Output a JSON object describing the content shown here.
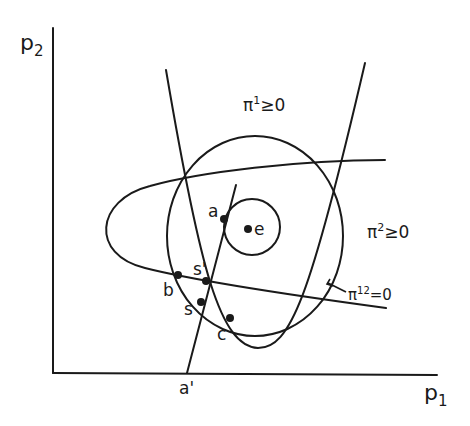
{
  "axes": {
    "y_label": "p",
    "y_sub": "2",
    "x_label": "p",
    "x_sub": "1"
  },
  "regions": {
    "pi1": {
      "sym": "π",
      "sup": "1",
      "rel": "≥0"
    },
    "pi2": {
      "sym": "π",
      "sup": "2",
      "rel": "≥0"
    },
    "pi12": {
      "sym": "π",
      "sup": "12",
      "rel": "=0"
    }
  },
  "points": {
    "a": "a",
    "e": "e",
    "s_prime": "s'",
    "b": "b",
    "s": "s",
    "c": "c",
    "a_prime": "a'"
  },
  "colors": {
    "ink": "#1a1a1a",
    "background": "#ffffff"
  }
}
